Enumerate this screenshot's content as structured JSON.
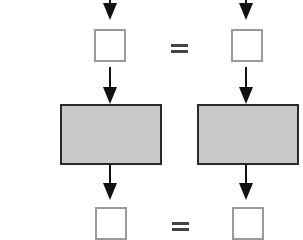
{
  "diagram": {
    "type": "flow-comparison",
    "columns": [
      {
        "name": "left",
        "input_box": "",
        "process_box": "",
        "output_box": ""
      },
      {
        "name": "right",
        "input_box": "",
        "process_box": "",
        "output_box": ""
      }
    ],
    "relations": [
      {
        "row": "top",
        "symbol": "="
      },
      {
        "row": "bottom",
        "symbol": "="
      }
    ],
    "colors": {
      "arrow": "#111111",
      "empty_square_border": "#9a9a9a",
      "process_fill": "#c9c9c9",
      "process_border": "#2a2a2a"
    }
  }
}
